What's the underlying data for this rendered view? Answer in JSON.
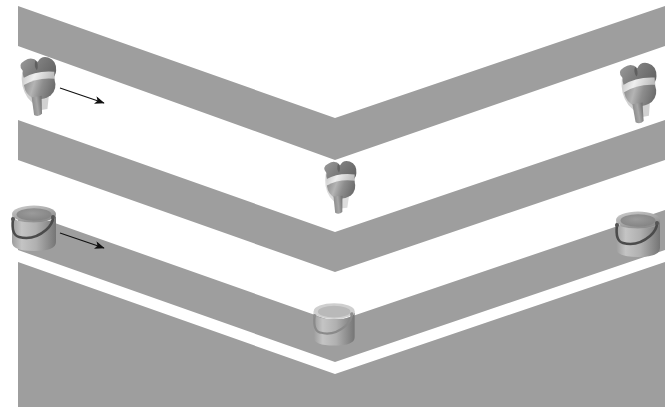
{
  "figure": {
    "name": "chevron-stripes-with-objects",
    "width": 671,
    "height": 411,
    "background_color": "#ffffff",
    "stripe_color": "#9e9e9e",
    "gap_color": "#ffffff",
    "margins": {
      "left": 18,
      "right": 6,
      "top": 6,
      "bottom": 4
    },
    "apex_x": 335
  },
  "chevrons": [
    {
      "name": "chevron-band-1",
      "index": 1,
      "left_top_y": 6,
      "apex_top_y": 118,
      "left_bottom_y": 46,
      "apex_bottom_y": 160,
      "right_top_y": 6,
      "right_bottom_y": 46,
      "color": "#9e9e9e"
    },
    {
      "name": "chevron-band-2",
      "index": 2,
      "left_top_y": 120,
      "apex_top_y": 232,
      "left_bottom_y": 160,
      "apex_bottom_y": 272,
      "right_top_y": 120,
      "right_bottom_y": 160,
      "color": "#9e9e9e"
    },
    {
      "name": "chevron-band-3",
      "index": 3,
      "left_top_y": 210,
      "apex_top_y": 322,
      "left_bottom_y": 250,
      "apex_bottom_y": 362,
      "right_top_y": 210,
      "right_bottom_y": 250,
      "color": "#9e9e9e"
    },
    {
      "name": "chevron-band-4",
      "index": 4,
      "left_top_y": 262,
      "apex_top_y": 374,
      "left_bottom_y": 407,
      "apex_bottom_y": 407,
      "right_top_y": 262,
      "right_bottom_y": 407,
      "color": "#9e9e9e"
    }
  ],
  "objects": {
    "row_top": {
      "name": "bone-joint-row",
      "object_type": "bone-joint",
      "count": 3,
      "items": [
        {
          "name": "bone-joint-left",
          "x": 14,
          "y": 54,
          "width": 50,
          "height": 62,
          "rotation": -8,
          "scale": 1.0
        },
        {
          "name": "bone-joint-middle",
          "x": 318,
          "y": 158,
          "width": 44,
          "height": 56,
          "rotation": -6,
          "scale": 0.9
        },
        {
          "name": "bone-joint-right",
          "x": 614,
          "y": 60,
          "width": 52,
          "height": 64,
          "rotation": -10,
          "scale": 1.02
        }
      ]
    },
    "row_bottom": {
      "name": "bucket-row",
      "object_type": "bucket",
      "count": 3,
      "items": [
        {
          "name": "bucket-left",
          "x": 8,
          "y": 202,
          "width": 52,
          "height": 50,
          "scale": 1.0
        },
        {
          "name": "bucket-middle",
          "x": 310,
          "y": 300,
          "width": 48,
          "height": 46,
          "scale": 0.93
        },
        {
          "name": "bucket-right",
          "x": 612,
          "y": 208,
          "width": 52,
          "height": 50,
          "scale": 1.0
        }
      ]
    }
  },
  "arrows": [
    {
      "name": "motion-arrow-top",
      "x1": 60,
      "y1": 88,
      "x2": 104,
      "y2": 103,
      "color": "#111111",
      "direction": "right-down",
      "label": ""
    },
    {
      "name": "motion-arrow-bottom",
      "x1": 60,
      "y1": 233,
      "x2": 104,
      "y2": 248,
      "color": "#111111",
      "direction": "right-down",
      "label": ""
    }
  ],
  "palette": {
    "stripe_gray": "#9e9e9e",
    "object_light": "#d9d9d9",
    "object_mid": "#a8a8a8",
    "object_dark": "#6f6f6f",
    "object_shadow": "#555555",
    "highlight": "#f0f0f0",
    "arrow": "#111111",
    "white": "#ffffff"
  }
}
